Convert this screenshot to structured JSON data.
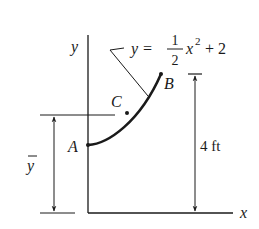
{
  "diagram": {
    "axes": {
      "x_label": "x",
      "y_label": "y"
    },
    "curve": {
      "equation_lhs": "y =",
      "frac_num": "1",
      "frac_den": "2",
      "equation_rest": "x",
      "exponent": "2",
      "equation_tail": "+ 2"
    },
    "points": {
      "start": "A",
      "end": "B",
      "centroid": "C"
    },
    "dimensions": {
      "height_label": "4 ft",
      "centroid_label": "y"
    },
    "colors": {
      "ink": "#1a1a1a",
      "background": "#ffffff"
    }
  }
}
